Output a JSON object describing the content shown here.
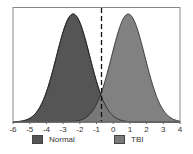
{
  "chart_data": {
    "type": "area",
    "title": "",
    "xlabel": "",
    "ylabel": "",
    "xlim": [
      -6,
      4
    ],
    "x_ticks": [
      -6,
      -5,
      -4,
      -3,
      -2,
      -1,
      0,
      1,
      2,
      3,
      4
    ],
    "grid": false,
    "legend_position": "bottom",
    "series": [
      {
        "name": "Normal",
        "distribution": "normal",
        "mean": -2.4,
        "sd": 1.0,
        "color": "#555555"
      },
      {
        "name": "TBI",
        "distribution": "normal",
        "mean": 0.9,
        "sd": 1.0,
        "color": "#7a7a7a"
      }
    ],
    "annotations": [
      {
        "type": "vertical-dashed-line",
        "x": -0.7,
        "color": "#111111"
      }
    ]
  },
  "legend": {
    "items": [
      {
        "label": "Normal",
        "color": "#555555"
      },
      {
        "label": "TBI",
        "color": "#7a7a7a"
      }
    ]
  }
}
